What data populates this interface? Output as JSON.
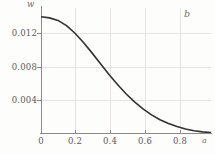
{
  "chart_data": {
    "type": "line",
    "title": "",
    "panel_label": "b",
    "xlabel": "a",
    "ylabel": "w",
    "xlim": [
      0,
      1.0
    ],
    "ylim": [
      0,
      0.0156
    ],
    "grid": true,
    "legend": null,
    "x_ticks": [
      0,
      0.2,
      0.4,
      0.6,
      0.8
    ],
    "x_tick_labels": [
      "0",
      "0.2",
      "0.4",
      "0.6",
      "0.8"
    ],
    "y_ticks": [
      0.004,
      0.008,
      0.012
    ],
    "y_tick_labels": [
      "0.004",
      "0.008",
      "0.012"
    ],
    "series": [
      {
        "name": "w(a)",
        "color": "#333133",
        "x": [
          0.0,
          0.05,
          0.1,
          0.15,
          0.2,
          0.25,
          0.3,
          0.35,
          0.4,
          0.45,
          0.5,
          0.55,
          0.6,
          0.65,
          0.7,
          0.75,
          0.8,
          0.85,
          0.9,
          0.95,
          1.0
        ],
        "y": [
          0.0145,
          0.01437,
          0.01405,
          0.0134,
          0.01245,
          0.0113,
          0.01,
          0.00865,
          0.0073,
          0.00605,
          0.0049,
          0.00388,
          0.003,
          0.00226,
          0.00166,
          0.00118,
          0.0008,
          0.0005,
          0.00028,
          0.00014,
          6e-05
        ]
      }
    ]
  },
  "axis_colors": {
    "axis": "#8a8a8a",
    "grid": "#e6e4e2",
    "text": "#59585a",
    "curve": "#333133"
  }
}
